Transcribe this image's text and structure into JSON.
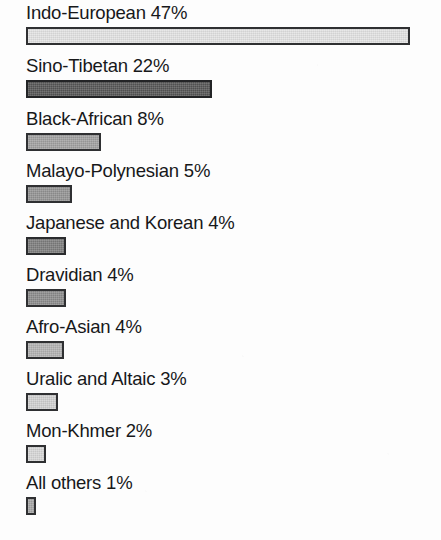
{
  "chart_data": {
    "type": "bar",
    "orientation": "horizontal",
    "title": "",
    "subtitle": "",
    "xlabel": "",
    "ylabel": "",
    "grid": false,
    "legend": "none",
    "axis_visible": false,
    "value_unit": "%",
    "xlim": [
      0,
      47
    ],
    "categories": [
      "Indo-European",
      "Sino-Tibetan",
      "Black-African",
      "Malayo-Polynesian",
      "Japanese and Korean",
      "Dravidian",
      "Afro-Asian",
      "Uralic and Altaic",
      "Mon-Khmer",
      "All others"
    ],
    "values": [
      47,
      22,
      8,
      5,
      4,
      4,
      4,
      3,
      2,
      1
    ],
    "labels": [
      "Indo-European 47%",
      "Sino-Tibetan 22%",
      "Black-African 8%",
      "Malayo-Polynesian 5%",
      "Japanese and Korean 4%",
      "Dravidian 4%",
      "Afro-Asian 4%",
      "Uralic and Altaic 3%",
      "Mon-Khmer 2%",
      "All others 1%"
    ],
    "bars": [
      {
        "label": "Indo-European 47%",
        "category": "Indo-European",
        "value": 47,
        "width_px": 384,
        "top_px": 2,
        "fill": "#e4e4e4",
        "stroke": "#2f3032"
      },
      {
        "label": "Sino-Tibetan 22%",
        "category": "Sino-Tibetan",
        "value": 22,
        "width_px": 186,
        "top_px": 55,
        "fill": "#565656",
        "stroke": "#232426"
      },
      {
        "label": "Black-African 8%",
        "category": "Black-African",
        "value": 8,
        "width_px": 75,
        "top_px": 108,
        "fill": "#a2a2a2",
        "stroke": "#2f3032"
      },
      {
        "label": "Malayo-Polynesian 5%",
        "category": "Malayo-Polynesian",
        "value": 5,
        "width_px": 46,
        "top_px": 160,
        "fill": "#949494",
        "stroke": "#2f3032"
      },
      {
        "label": "Japanese and Korean 4%",
        "category": "Japanese and Korean",
        "value": 4,
        "width_px": 40,
        "top_px": 212,
        "fill": "#7e7e7e",
        "stroke": "#2b2c2e"
      },
      {
        "label": "Dravidian 4%",
        "category": "Dravidian",
        "value": 4,
        "width_px": 40,
        "top_px": 264,
        "fill": "#8d8d8d",
        "stroke": "#2f3032"
      },
      {
        "label": "Afro-Asian 4%",
        "category": "Afro-Asian",
        "value": 4,
        "width_px": 38,
        "top_px": 316,
        "fill": "#b4b4b4",
        "stroke": "#2f3032"
      },
      {
        "label": "Uralic and Altaic 3%",
        "category": "Uralic and Altaic",
        "value": 3,
        "width_px": 32,
        "top_px": 368,
        "fill": "#d2d2d2",
        "stroke": "#2f3032"
      },
      {
        "label": "Mon-Khmer 2%",
        "category": "Mon-Khmer",
        "value": 2,
        "width_px": 20,
        "top_px": 420,
        "fill": "#d8d8d8",
        "stroke": "#2f3032"
      },
      {
        "label": "All others 1%",
        "category": "All others",
        "value": 1,
        "width_px": 10,
        "top_px": 472,
        "fill": "#a8a8a8",
        "stroke": "#2f3032"
      }
    ]
  },
  "colors": {
    "page_background": "#fdfdfd",
    "text": "#17181a",
    "bar_stroke": "#2f3032"
  }
}
